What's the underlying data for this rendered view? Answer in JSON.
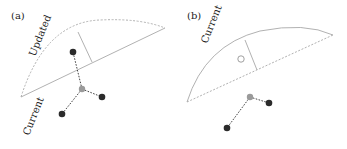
{
  "panels": [
    {
      "id": "a",
      "label": "(a)",
      "arc_label": "Updated",
      "chord_label": "Current",
      "arc_style": "dashed",
      "chord_style": "solid"
    },
    {
      "id": "b",
      "label": "(b)",
      "arc_label": "Current",
      "arc_style": "solid",
      "chord_style": "dashed"
    }
  ],
  "colors": {
    "line": "#a8a8a8",
    "dark_dot": "#2b2b2b",
    "center_dot": "#9a9a9a",
    "connector": "#444444"
  }
}
